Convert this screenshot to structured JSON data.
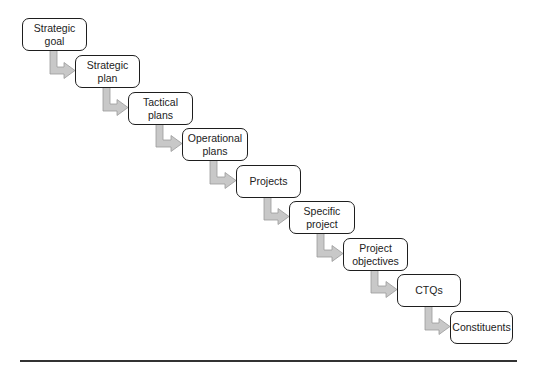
{
  "diagram": {
    "type": "cascade-flow",
    "colors": {
      "box_border": "#1e1e1e",
      "arrow_fill": "#c8c8c8",
      "arrow_edge": "#9a9a9a",
      "rule": "#333333"
    },
    "steps": [
      {
        "label": "Strategic goal",
        "lines": [
          "Strategic",
          "goal"
        ],
        "x": 22,
        "y": 18,
        "w": 65,
        "h": 33
      },
      {
        "label": "Strategic plan",
        "lines": [
          "Strategic",
          "plan"
        ],
        "x": 75,
        "y": 55,
        "w": 65,
        "h": 33
      },
      {
        "label": "Tactical plans",
        "lines": [
          "Tactical",
          "plans"
        ],
        "x": 128,
        "y": 92,
        "w": 65,
        "h": 33
      },
      {
        "label": "Operational plans",
        "lines": [
          "Operational",
          "plans"
        ],
        "x": 182,
        "y": 128,
        "w": 66,
        "h": 33
      },
      {
        "label": "Projects",
        "lines": [
          "Projects"
        ],
        "x": 236,
        "y": 165,
        "w": 65,
        "h": 33
      },
      {
        "label": "Specific project",
        "lines": [
          "Specific",
          "project"
        ],
        "x": 289,
        "y": 201,
        "w": 66,
        "h": 33
      },
      {
        "label": "Project objectives",
        "lines": [
          "Project",
          "objectives"
        ],
        "x": 343,
        "y": 238,
        "w": 65,
        "h": 33
      },
      {
        "label": "CTQs",
        "lines": [
          "CTQs"
        ],
        "x": 397,
        "y": 274,
        "w": 64,
        "h": 33
      },
      {
        "label": "Constituents",
        "lines": [
          "Constituents"
        ],
        "x": 450,
        "y": 311,
        "w": 63,
        "h": 33
      }
    ]
  }
}
